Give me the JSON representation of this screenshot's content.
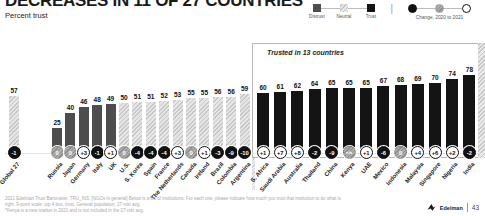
{
  "header": {
    "title": "DECREASES IN 11 OF 27 COUNTRIES",
    "subtitle": "Percent trust"
  },
  "legend": {
    "bands": [
      {
        "label": "Distrust",
        "band": "distrust"
      },
      {
        "label": "Neutral",
        "band": "neutral"
      },
      {
        "label": "Trust",
        "band": "trust"
      }
    ],
    "change_caption": "Change, 2020 to 2021",
    "change_styles": [
      "negative",
      "zero",
      "positive"
    ]
  },
  "chart_data": {
    "type": "bar",
    "title": "Percent trust",
    "ylabel": "Percent trust",
    "ylim": [
      0,
      100
    ],
    "group_label": "Trusted in 13 countries",
    "bands_meaning": {
      "distrust": "1-49",
      "neutral": "50-59",
      "trust": "60-100"
    },
    "bars": [
      {
        "label": "Global 27",
        "value": 57,
        "change": "-1",
        "band": "neutral",
        "change_style": "negative"
      },
      {
        "label": "Russia",
        "value": 25,
        "change": "0",
        "band": "distrust",
        "change_style": "zero"
      },
      {
        "label": "Japan",
        "value": 40,
        "change": "0",
        "band": "distrust",
        "change_style": "zero"
      },
      {
        "label": "Germany",
        "value": 46,
        "change": "+3",
        "band": "distrust",
        "change_style": "positive"
      },
      {
        "label": "Italy",
        "value": 48,
        "change": "-1",
        "band": "distrust",
        "change_style": "negative"
      },
      {
        "label": "UK",
        "value": 49,
        "change": "+1",
        "band": "distrust",
        "change_style": "positive"
      },
      {
        "label": "U.S.",
        "value": 50,
        "change": "0",
        "band": "neutral",
        "change_style": "zero"
      },
      {
        "label": "S. Korea",
        "value": 51,
        "change": "-4",
        "band": "neutral",
        "change_style": "negative"
      },
      {
        "label": "Spain",
        "value": 51,
        "change": "-4",
        "band": "neutral",
        "change_style": "negative"
      },
      {
        "label": "France",
        "value": 52,
        "change": "-4",
        "band": "neutral",
        "change_style": "negative"
      },
      {
        "label": "The Netherlands",
        "value": 53,
        "change": "+3",
        "band": "neutral",
        "change_style": "positive"
      },
      {
        "label": "Canada",
        "value": 55,
        "change": "0",
        "band": "neutral",
        "change_style": "zero"
      },
      {
        "label": "Ireland",
        "value": 55,
        "change": "+1",
        "band": "neutral",
        "change_style": "positive"
      },
      {
        "label": "Brazil",
        "value": 56,
        "change": "-3",
        "band": "neutral",
        "change_style": "negative"
      },
      {
        "label": "Colombia",
        "value": 56,
        "change": "-9",
        "band": "neutral",
        "change_style": "negative"
      },
      {
        "label": "Argentina",
        "value": 59,
        "change": "-10",
        "band": "neutral",
        "change_style": "negative"
      },
      {
        "label": "S. Africa",
        "value": 60,
        "change": "+1",
        "band": "trust",
        "change_style": "positive"
      },
      {
        "label": "Saudi Arabia",
        "value": 61,
        "change": "+7",
        "band": "trust",
        "change_style": "positive"
      },
      {
        "label": "Australia",
        "value": 62,
        "change": "+8",
        "band": "trust",
        "change_style": "positive"
      },
      {
        "label": "Thailand",
        "value": 64,
        "change": "-2",
        "band": "trust",
        "change_style": "negative"
      },
      {
        "label": "China",
        "value": 65,
        "change": "-9",
        "band": "trust",
        "change_style": "negative"
      },
      {
        "label": "Kenya",
        "value": 65,
        "change": "n/a",
        "band": "trust",
        "change_style": "na"
      },
      {
        "label": "UAE",
        "value": 65,
        "change": "+1",
        "band": "trust",
        "change_style": "positive"
      },
      {
        "label": "Mexico",
        "value": 67,
        "change": "-6",
        "band": "trust",
        "change_style": "negative"
      },
      {
        "label": "Indonesia",
        "value": 68,
        "change": "0",
        "band": "trust",
        "change_style": "zero"
      },
      {
        "label": "Malaysia",
        "value": 69,
        "change": "+4",
        "band": "trust",
        "change_style": "positive"
      },
      {
        "label": "Singapore",
        "value": 70,
        "change": "+6",
        "band": "trust",
        "change_style": "positive"
      },
      {
        "label": "Nigeria",
        "value": 74,
        "change": "+2",
        "band": "trust",
        "change_style": "positive"
      },
      {
        "label": "India",
        "value": 78,
        "change": "-2",
        "band": "trust",
        "change_style": "negative"
      }
    ]
  },
  "footer": {
    "source_line1": "2021 Edelman Trust Barometer. TRU_INS. [NGOs in general] Below is a list of institutions. For each one, please indicate how much you trust that institution to do what is right. 9-point scale; top 4 box, trust. General population, 27-mkt avg.",
    "source_line2": "*Kenya is a new market in 2021 and is not included in the 27-mkt avg.",
    "brand": "Edelman",
    "page": "43"
  },
  "colors": {
    "trust": "#141414",
    "distrust": "#4d4d4d",
    "neutral": "#d9d9d9",
    "badge_negative": "#111111",
    "badge_positive": "#ffffff",
    "badge_zero": "#9b9b9b"
  }
}
